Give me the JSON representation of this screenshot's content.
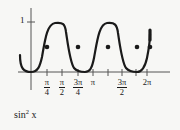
{
  "figure": {
    "caption": "sin",
    "caption_exponent": "2",
    "caption_variable": "x",
    "y_axis_label": "1",
    "curve_color": "#1a1a1a",
    "axis_color": "#4a4a4a",
    "background_color": "#f7f7f5"
  },
  "x_ticks": [
    {
      "name": "pi-over-4",
      "num": "π",
      "den": "4",
      "x": 47
    },
    {
      "name": "pi-over-2",
      "num": "π",
      "den": "2",
      "x": 62
    },
    {
      "name": "3pi-over-4",
      "num": "3π",
      "den": "4",
      "x": 78
    },
    {
      "name": "pi",
      "num": "π",
      "den": "",
      "x": 93
    },
    {
      "name": "3pi-over-2",
      "num": "3π",
      "den": "2",
      "x": 122
    },
    {
      "name": "2pi",
      "num": "2π",
      "den": "",
      "x": 147
    }
  ],
  "chart_data": {
    "type": "line",
    "xlabel": "",
    "ylabel": "",
    "function": "sin^2(x)",
    "xlim": [
      -0.55,
      7.0
    ],
    "ylim": [
      0,
      1.18
    ],
    "grid": false,
    "legend": "none",
    "x_tick_values": [
      0.7854,
      1.5708,
      2.3562,
      3.1416,
      4.7124,
      6.2832
    ],
    "x_tick_labels": [
      "π/4",
      "π/2",
      "3π/4",
      "π",
      "3π/2",
      "2π"
    ],
    "y_tick_values": [
      1
    ],
    "y_tick_labels": [
      "1"
    ],
    "markers": {
      "note": "filled dots at y = 0.5 (half maximum)",
      "x": [
        0.7854,
        2.3562,
        3.927,
        5.4978,
        6.2832
      ],
      "y": [
        0.5,
        0.5,
        0.5,
        0.5,
        0.5
      ]
    },
    "maxima_x": [
      1.5708,
      4.7124
    ],
    "minima_x": [
      0,
      3.1416,
      6.2832
    ],
    "series": [
      {
        "name": "sin^2 x",
        "x": [
          -0.55,
          -0.35,
          -0.15,
          0.0,
          0.2,
          0.4,
          0.6,
          0.7854,
          1.0,
          1.2,
          1.4,
          1.5708,
          1.75,
          1.95,
          2.15,
          2.3562,
          2.55,
          2.75,
          2.95,
          3.1416,
          3.35,
          3.55,
          3.75,
          3.927,
          4.1,
          4.3,
          4.5,
          4.7124,
          4.9,
          5.1,
          5.3,
          5.4978,
          5.7,
          5.9,
          6.1,
          6.2832
        ],
        "y": [
          0.27,
          0.12,
          0.022,
          0.0,
          0.039,
          0.152,
          0.319,
          0.5,
          0.708,
          0.869,
          0.985,
          1.0,
          0.969,
          0.861,
          0.7,
          0.5,
          0.3,
          0.14,
          0.035,
          0.0,
          0.043,
          0.162,
          0.332,
          0.5,
          0.66,
          0.83,
          0.968,
          1.0,
          0.958,
          0.84,
          0.67,
          0.5,
          0.3,
          0.13,
          0.03,
          0.0
        ]
      }
    ]
  }
}
